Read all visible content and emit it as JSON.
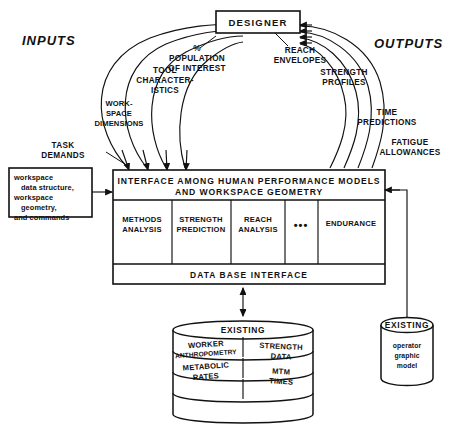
{
  "diagram": {
    "title_box": {
      "label": "DESIGNER"
    },
    "side_labels": {
      "inputs": "INPUTS",
      "outputs": "OUTPUTS"
    },
    "inputs": [
      {
        "line1": "TASK",
        "line2": "DEMANDS",
        "line3": ""
      },
      {
        "line1": "WORK-",
        "line2": "SPACE",
        "line3": "DIMENSIONS"
      },
      {
        "line1": "TOOL",
        "line2": "CHARACTER-",
        "line3": "ISTICS"
      },
      {
        "line1": "%",
        "line2": "POPULATION",
        "line3": "OF INTEREST"
      }
    ],
    "outputs": [
      {
        "line1": "REACH",
        "line2": "ENVELOPES"
      },
      {
        "line1": "STRENGTH",
        "line2": "PROFILES"
      },
      {
        "line1": "TIME",
        "line2": "PREDICTIONS"
      },
      {
        "line1": "FATIGUE",
        "line2": "ALLOWANCES"
      }
    ],
    "input_data_box": {
      "lines": [
        "workspace",
        "data structure,",
        "workspace",
        "geometry,",
        "and commands"
      ]
    },
    "interface_box": {
      "title_line1": "INTERFACE AMONG HUMAN PERFORMANCE MODELS",
      "title_line2": "AND WORKSPACE GEOMETRY",
      "modules": [
        {
          "line1": "METHODS",
          "line2": "ANALYSIS"
        },
        {
          "line1": "STRENGTH",
          "line2": "PREDICTION"
        },
        {
          "line1": "REACH",
          "line2": "ANALYSIS"
        },
        {
          "line1": "•••",
          "line2": ""
        },
        {
          "line1": "ENDURANCE",
          "line2": ""
        }
      ],
      "footer": "DATA BASE INTERFACE"
    },
    "database": {
      "header": "EXISTING",
      "cells": [
        {
          "line1": "WORKER",
          "line2": "ANTHROPOMETRY"
        },
        {
          "line1": "STRENGTH",
          "line2": "DATA"
        },
        {
          "line1": "METABOLIC",
          "line2": "RATES"
        },
        {
          "line1": "MTM",
          "line2": "TIMES"
        }
      ]
    },
    "operator_model": {
      "header": "EXISTING",
      "lines": [
        "operator",
        "graphic",
        "model"
      ]
    },
    "colors": {
      "ink": "#111111",
      "paper": "#ffffff"
    }
  }
}
